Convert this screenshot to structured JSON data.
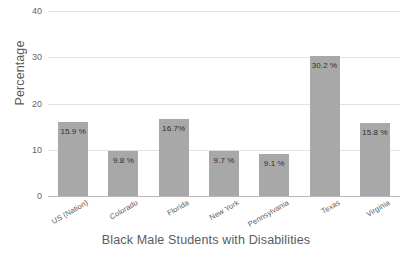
{
  "chart_data": {
    "type": "bar",
    "title": "",
    "xlabel": "Black Male Students with Disabilities",
    "ylabel": "Percentage",
    "categories": [
      "US (Nation)",
      "Colorado",
      "Florida",
      "New York",
      "Pennsylvania",
      "Texas",
      "Virginia"
    ],
    "values": [
      15.9,
      9.8,
      16.7,
      9.7,
      9.1,
      30.2,
      15.8
    ],
    "data_labels": [
      "15.9 %",
      "9.8 %",
      "16.7%",
      "9.7 %",
      "9.1 %",
      "30.2 %",
      "15.8 %"
    ],
    "ylim": [
      0,
      40
    ],
    "yticks": [
      0,
      10,
      20,
      30,
      40
    ],
    "ytick_labels": [
      "0",
      "10",
      "20",
      "30",
      "40"
    ],
    "grid": true,
    "legend": "none",
    "bar_color": "#a8a8a8",
    "gridline_color": "#e2e2e2",
    "axis_color": "#b8b8b8",
    "background_color": "#ffffff",
    "label_text_color": "#2f2f30"
  }
}
